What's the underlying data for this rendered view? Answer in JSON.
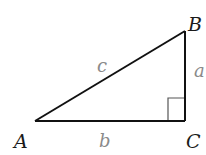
{
  "diagram": {
    "type": "right-triangle",
    "colors": {
      "stroke": "#111111",
      "right_angle_marker": "#555555",
      "vertex_label": "#1a1a1a",
      "side_label": "#8a8a8a"
    },
    "vertices": {
      "A": {
        "label": "A",
        "x": 35,
        "y": 121
      },
      "B": {
        "label": "B",
        "x": 185,
        "y": 31
      },
      "C": {
        "label": "C",
        "x": 185,
        "y": 121
      }
    },
    "sides": {
      "a": {
        "label": "a",
        "between": "B-C"
      },
      "b": {
        "label": "b",
        "between": "A-C"
      },
      "c": {
        "label": "c",
        "between": "A-B"
      }
    },
    "right_angle_at": "C"
  }
}
